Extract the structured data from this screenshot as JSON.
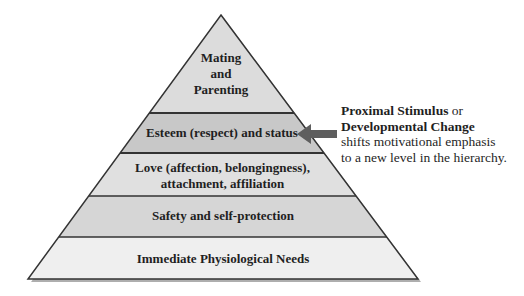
{
  "diagram": {
    "type": "hierarchy-pyramid",
    "levels": [
      {
        "id": "mating",
        "label_lines": [
          "Mating",
          "and",
          "Parenting"
        ],
        "fill": "#dcdcdc",
        "highlighted": false
      },
      {
        "id": "esteem",
        "label_lines": [
          "Esteem (respect) and status"
        ],
        "fill": "#c8c8c8",
        "highlighted": true
      },
      {
        "id": "love",
        "label_lines": [
          "Love (affection, belongingness),",
          "attachment, affiliation"
        ],
        "fill": "#e0e0e0",
        "highlighted": false
      },
      {
        "id": "safety",
        "label_lines": [
          "Safety and self-protection"
        ],
        "fill": "#d6d6d6",
        "highlighted": false
      },
      {
        "id": "physiological",
        "label_lines": [
          "Immediate Physiological Needs"
        ],
        "fill": "#efefef",
        "highlighted": false
      }
    ],
    "arrow": {
      "direction": "left",
      "points_to": "esteem",
      "color": "#5e5e5e"
    },
    "callout": {
      "bold1": "Proximal Stimulus",
      "plain1": " or",
      "bold2": "Developmental Change",
      "line3": "shifts motivational emphasis",
      "line4": "to a new level in the hierarchy."
    },
    "colors": {
      "outline": "#333333",
      "shadow": "#8a8a8a",
      "text": "#1f1f1f"
    }
  }
}
